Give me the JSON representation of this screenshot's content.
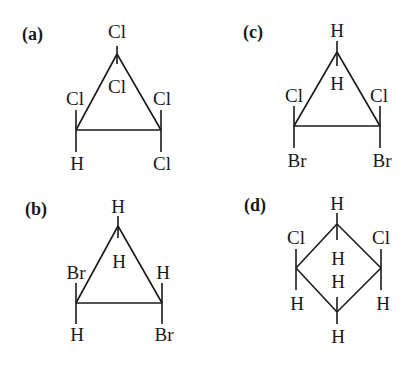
{
  "figure": {
    "structures": [
      {
        "label": "(a)",
        "ring": "cyclopropane",
        "top": {
          "up": "Cl",
          "down": "Cl"
        },
        "left": {
          "up": "Cl",
          "down": "H"
        },
        "right": {
          "up": "Cl",
          "down": "Cl"
        }
      },
      {
        "label": "(b)",
        "ring": "cyclopropane",
        "top": {
          "up": "H",
          "down": "H"
        },
        "left": {
          "up": "Br",
          "down": "H"
        },
        "right": {
          "up": "H",
          "down": "Br"
        }
      },
      {
        "label": "(c)",
        "ring": "cyclopropane",
        "top": {
          "up": "H",
          "down": "H"
        },
        "left": {
          "up": "Cl",
          "down": "Br"
        },
        "right": {
          "up": "Cl",
          "down": "Br"
        }
      },
      {
        "label": "(d)",
        "ring": "cyclobutane",
        "top": {
          "up": "H",
          "down": "H"
        },
        "left": {
          "up": "Cl",
          "down": "H"
        },
        "right": {
          "up": "Cl",
          "down": "H"
        },
        "bottom": {
          "up": "H",
          "down": "H"
        }
      }
    ]
  }
}
